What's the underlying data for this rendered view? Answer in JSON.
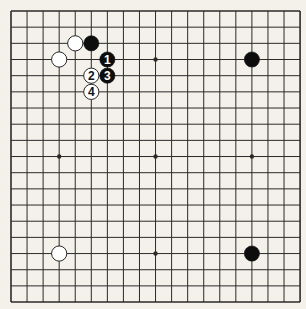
{
  "board": {
    "size": 19,
    "origin_x": 11,
    "origin_y": 11,
    "spacing_x": 16.06,
    "spacing_y": 16.17,
    "background_color": "#f3f1ea",
    "line_color": "#2a2a2a",
    "black_stone_color": "#0d0d0d",
    "white_stone_color": "#ffffff",
    "stone_radius": 7.6
  },
  "hoshi": [
    {
      "col": 3,
      "row": 3
    },
    {
      "col": 9,
      "row": 3
    },
    {
      "col": 15,
      "row": 3
    },
    {
      "col": 3,
      "row": 9
    },
    {
      "col": 9,
      "row": 9
    },
    {
      "col": 15,
      "row": 9
    },
    {
      "col": 3,
      "row": 15
    },
    {
      "col": 9,
      "row": 15
    },
    {
      "col": 15,
      "row": 15
    }
  ],
  "stones": [
    {
      "color": "white",
      "col": 4,
      "row": 2,
      "label": ""
    },
    {
      "color": "black",
      "col": 5,
      "row": 2,
      "label": ""
    },
    {
      "color": "white",
      "col": 3,
      "row": 3,
      "label": ""
    },
    {
      "color": "black",
      "col": 15,
      "row": 3,
      "label": ""
    },
    {
      "color": "black",
      "col": 6,
      "row": 3,
      "label": "1"
    },
    {
      "color": "white",
      "col": 5,
      "row": 4,
      "label": "2"
    },
    {
      "color": "black",
      "col": 6,
      "row": 4,
      "label": "3"
    },
    {
      "color": "white",
      "col": 5,
      "row": 5,
      "label": "4"
    },
    {
      "color": "white",
      "col": 3,
      "row": 15,
      "label": ""
    },
    {
      "color": "black",
      "col": 15,
      "row": 15,
      "label": ""
    }
  ]
}
